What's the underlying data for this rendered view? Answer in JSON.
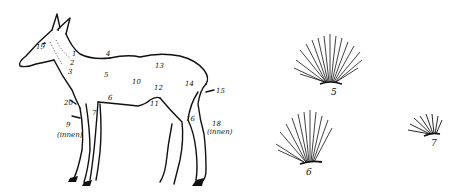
{
  "figure": {
    "ink_color": "#111111",
    "background": "#ffffff",
    "deer_labels": [
      {
        "id": "19",
        "text": "19",
        "x": 36,
        "y": 48
      },
      {
        "id": "1",
        "text": "1",
        "x": 72,
        "y": 55
      },
      {
        "id": "2",
        "text": "2",
        "x": 70,
        "y": 64
      },
      {
        "id": "3",
        "text": "3",
        "x": 68,
        "y": 73
      },
      {
        "id": "4",
        "text": "4",
        "x": 106,
        "y": 55
      },
      {
        "id": "5",
        "text": "5",
        "x": 104,
        "y": 72
      },
      {
        "id": "6",
        "text": "6",
        "x": 108,
        "y": 97
      },
      {
        "id": "7",
        "text": "7",
        "x": 92,
        "y": 110
      },
      {
        "id": "10",
        "text": "10",
        "x": 132,
        "y": 79
      },
      {
        "id": "11",
        "text": "11",
        "x": 150,
        "y": 101
      },
      {
        "id": "12",
        "text": "12",
        "x": 154,
        "y": 85
      },
      {
        "id": "13",
        "text": "13",
        "x": 155,
        "y": 63
      },
      {
        "id": "14",
        "text": "14",
        "x": 185,
        "y": 81
      },
      {
        "id": "15",
        "text": "15",
        "x": 215,
        "y": 89
      },
      {
        "id": "16",
        "text": "16",
        "x": 187,
        "y": 116
      },
      {
        "id": "18",
        "text": "18",
        "x": 212,
        "y": 121
      },
      {
        "id": "20",
        "text": "20",
        "x": 64,
        "y": 102
      },
      {
        "id": "9",
        "text": "9",
        "x": 66,
        "y": 125
      },
      {
        "id": "innen-front",
        "text": "(innen)",
        "x": 58,
        "y": 134
      },
      {
        "id": "innen-hind",
        "text": "(innen)",
        "x": 208,
        "y": 129
      }
    ],
    "hair_samples": [
      {
        "label": "5",
        "x": 334,
        "y": 92
      },
      {
        "label": "6",
        "x": 309,
        "y": 173
      },
      {
        "label": "7",
        "x": 433,
        "y": 141
      }
    ]
  }
}
